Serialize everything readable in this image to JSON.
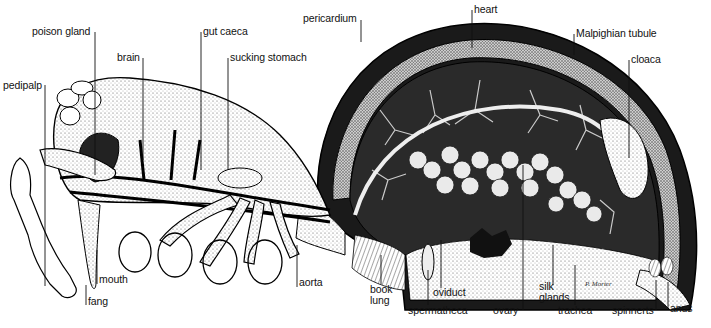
{
  "diagram": {
    "signature": "P. Morter",
    "colors": {
      "ink": "#111111",
      "stipple": "#8a8a8a",
      "background": "#ffffff"
    },
    "labels": [
      {
        "id": "poison-gland",
        "text": "poison gland",
        "x": 32,
        "y": 26
      },
      {
        "id": "gut-caeca",
        "text": "gut caeca",
        "x": 203,
        "y": 26
      },
      {
        "id": "pericardium",
        "text": "pericardium",
        "x": 303,
        "y": 13
      },
      {
        "id": "heart",
        "text": "heart",
        "x": 474,
        "y": 10
      },
      {
        "id": "malpighian-tubule",
        "text": "Malpighian tubule",
        "x": 576,
        "y": 28
      },
      {
        "id": "cloaca",
        "text": "cloaca",
        "x": 631,
        "y": 54
      },
      {
        "id": "brain",
        "text": "brain",
        "x": 117,
        "y": 52
      },
      {
        "id": "sucking-stomach",
        "text": "sucking stomach",
        "x": 230,
        "y": 52
      },
      {
        "id": "pedipalp",
        "text": "pedipalp",
        "x": 3,
        "y": 80
      },
      {
        "id": "mouth",
        "text": "mouth",
        "x": 99,
        "y": 274
      },
      {
        "id": "fang",
        "text": "fang",
        "x": 88,
        "y": 296
      },
      {
        "id": "aorta",
        "text": "aorta",
        "x": 299,
        "y": 277
      },
      {
        "id": "book-lung",
        "text": "book\nlung",
        "x": 370,
        "y": 284
      },
      {
        "id": "oviduct",
        "text": "oviduct",
        "x": 433,
        "y": 287
      },
      {
        "id": "spermatheca",
        "text": "spermatheca",
        "x": 408,
        "y": 305
      },
      {
        "id": "ovary",
        "text": "ovary",
        "x": 493,
        "y": 305
      },
      {
        "id": "silk-glands",
        "text": "silk\nglands",
        "x": 539,
        "y": 281
      },
      {
        "id": "trachea",
        "text": "trachea",
        "x": 558,
        "y": 305
      },
      {
        "id": "spinnerets",
        "text": "spinnerts",
        "x": 612,
        "y": 305
      },
      {
        "id": "anus",
        "text": "anus",
        "x": 670,
        "y": 303
      }
    ]
  }
}
